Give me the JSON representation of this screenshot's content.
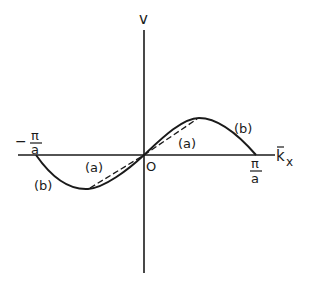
{
  "diagram": {
    "axes": {
      "y_label": "v",
      "x_label": "k",
      "x_label_subscript": "x",
      "origin_label": "O"
    },
    "ticks": {
      "left": {
        "sign": "−",
        "numerator": "π",
        "denominator": "a"
      },
      "right": {
        "numerator": "π",
        "denominator": "a"
      }
    },
    "curves": [
      {
        "id": "a",
        "label": "(a)",
        "style": "dashed",
        "description": "linear approximation"
      },
      {
        "id": "b",
        "label": "(b)",
        "style": "solid",
        "description": "sinusoidal dispersion"
      }
    ],
    "colors": {
      "ink": "#1a1a1a",
      "background": "#ffffff"
    }
  }
}
